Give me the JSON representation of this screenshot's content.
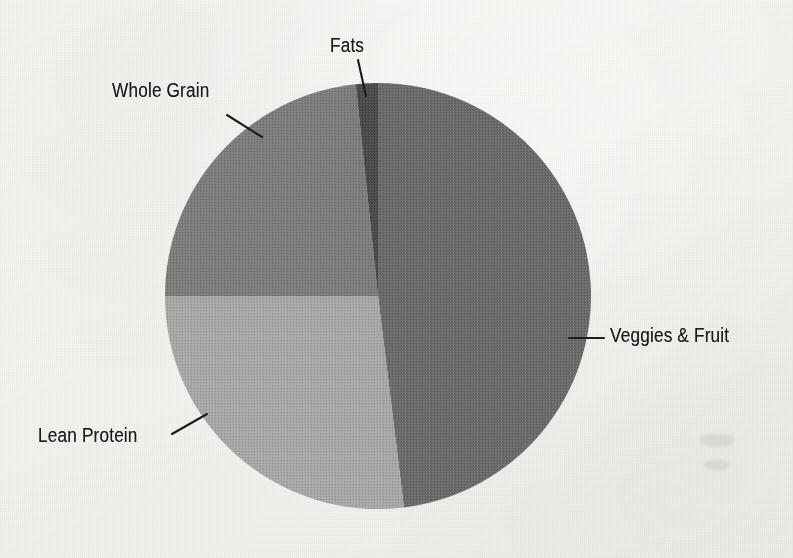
{
  "page": {
    "background_color": "#f6f5f2",
    "ink_color": "#1b1b1b",
    "media": "scanned-book-page"
  },
  "chart_data": {
    "type": "pie",
    "title": "",
    "subtitle": "",
    "xlabel": "",
    "ylabel": "",
    "legend_position": "none",
    "labels_position": "outside-with-leader-lines",
    "grid": false,
    "start_angle_deg": -6,
    "direction": "clockwise",
    "center": {
      "x": 378,
      "y": 296
    },
    "radius": 213,
    "categories": [
      "Fats",
      "Veggies & Fruit",
      "Lean Protein",
      "Whole Grain"
    ],
    "values": [
      2,
      48,
      27,
      23
    ],
    "unit": "percent",
    "slices": [
      {
        "name": "fats",
        "label": "Fats",
        "value": 2,
        "color": "#4a4a4a",
        "start_angle_deg": -6,
        "end_angle_deg": 0,
        "leader": {
          "x1": 358,
          "y1": 60,
          "x2": 366,
          "y2": 96
        },
        "label_x": 330,
        "label_y": 34
      },
      {
        "name": "veggies-and-fruit",
        "label": "Veggies & Fruit",
        "value": 48,
        "color": "#6b6b6b",
        "start_angle_deg": 0,
        "end_angle_deg": 173,
        "leader": {
          "x1": 569,
          "y1": 338,
          "x2": 604,
          "y2": 338
        },
        "label_x": 610,
        "label_y": 324
      },
      {
        "name": "lean-protein",
        "label": "Lean Protein",
        "value": 27,
        "color": "#a9a9a9",
        "start_angle_deg": 173,
        "end_angle_deg": 270,
        "leader": {
          "x1": 172,
          "y1": 434,
          "x2": 207,
          "y2": 414
        },
        "label_x": 38,
        "label_y": 424
      },
      {
        "name": "whole-grain",
        "label": "Whole Grain",
        "value": 23,
        "color": "#7d7d7d",
        "start_angle_deg": 270,
        "end_angle_deg": 354,
        "leader": {
          "x1": 227,
          "y1": 115,
          "x2": 262,
          "y2": 137
        },
        "label_x": 112,
        "label_y": 79
      }
    ]
  }
}
